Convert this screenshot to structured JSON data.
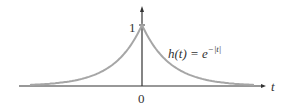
{
  "chart_data": {
    "type": "line",
    "title": "",
    "function_label": "h(t) = e^{-|t|}",
    "function_label_parts": {
      "lhs": "h(t) = e",
      "exp": "−|t|"
    },
    "xlabel": "t",
    "ylabel": "",
    "x_ticks": [
      "0"
    ],
    "y_ticks": [
      "1"
    ],
    "x": [
      -4,
      -3,
      -2,
      -1.5,
      -1,
      -0.5,
      0,
      0.5,
      1,
      1.5,
      2,
      3,
      4
    ],
    "values": [
      0.018,
      0.05,
      0.135,
      0.223,
      0.368,
      0.607,
      1,
      0.607,
      0.368,
      0.223,
      0.135,
      0.05,
      0.018
    ],
    "xlim": [
      -4.2,
      4.2
    ],
    "ylim": [
      0,
      1.15
    ],
    "grid": false,
    "legend": "none",
    "colors": {
      "curve": "#a6a6a6",
      "axes": "#333333"
    }
  }
}
